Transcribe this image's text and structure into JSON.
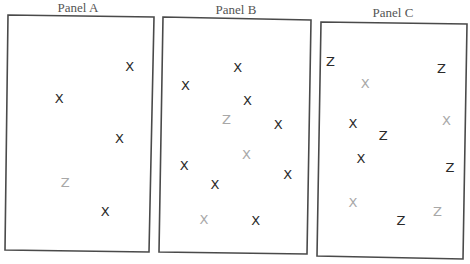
{
  "figure": {
    "colors": {
      "dark": "#2a2a2a",
      "light": "#a8a8a8"
    },
    "panels": [
      {
        "id": "a",
        "title": "Panel A",
        "items": [
          {
            "letter": "X",
            "shade": "dark",
            "pos": [
              0.84,
              0.21
            ]
          },
          {
            "letter": "X",
            "shade": "dark",
            "pos": [
              0.36,
              0.35
            ]
          },
          {
            "letter": "X",
            "shade": "dark",
            "pos": [
              0.78,
              0.52
            ]
          },
          {
            "letter": "Z",
            "shade": "light",
            "pos": [
              0.41,
              0.71
            ]
          },
          {
            "letter": "X",
            "shade": "dark",
            "pos": [
              0.69,
              0.83
            ]
          }
        ]
      },
      {
        "id": "b",
        "title": "Panel B",
        "items": [
          {
            "letter": "X",
            "shade": "dark",
            "pos": [
              0.51,
              0.21
            ]
          },
          {
            "letter": "X",
            "shade": "dark",
            "pos": [
              0.16,
              0.29
            ]
          },
          {
            "letter": "X",
            "shade": "dark",
            "pos": [
              0.58,
              0.35
            ]
          },
          {
            "letter": "Z",
            "shade": "light",
            "pos": [
              0.44,
              0.43
            ]
          },
          {
            "letter": "X",
            "shade": "dark",
            "pos": [
              0.79,
              0.45
            ]
          },
          {
            "letter": "X",
            "shade": "light",
            "pos": [
              0.58,
              0.58
            ]
          },
          {
            "letter": "X",
            "shade": "dark",
            "pos": [
              0.16,
              0.63
            ]
          },
          {
            "letter": "X",
            "shade": "dark",
            "pos": [
              0.86,
              0.66
            ]
          },
          {
            "letter": "X",
            "shade": "dark",
            "pos": [
              0.37,
              0.71
            ]
          },
          {
            "letter": "X",
            "shade": "light",
            "pos": [
              0.3,
              0.86
            ]
          },
          {
            "letter": "X",
            "shade": "dark",
            "pos": [
              0.65,
              0.86
            ]
          }
        ]
      },
      {
        "id": "c",
        "title": "Panel C",
        "items": [
          {
            "letter": "Z",
            "shade": "dark",
            "pos": [
              0.07,
              0.17
            ]
          },
          {
            "letter": "Z",
            "shade": "dark",
            "pos": [
              0.83,
              0.19
            ]
          },
          {
            "letter": "X",
            "shade": "light",
            "pos": [
              0.31,
              0.26
            ]
          },
          {
            "letter": "X",
            "shade": "light",
            "pos": [
              0.87,
              0.41
            ]
          },
          {
            "letter": "X",
            "shade": "dark",
            "pos": [
              0.23,
              0.43
            ]
          },
          {
            "letter": "Z",
            "shade": "dark",
            "pos": [
              0.44,
              0.48
            ]
          },
          {
            "letter": "X",
            "shade": "dark",
            "pos": [
              0.29,
              0.58
            ]
          },
          {
            "letter": "Z",
            "shade": "dark",
            "pos": [
              0.9,
              0.61
            ]
          },
          {
            "letter": "X",
            "shade": "light",
            "pos": [
              0.24,
              0.77
            ]
          },
          {
            "letter": "Z",
            "shade": "light",
            "pos": [
              0.82,
              0.8
            ]
          },
          {
            "letter": "Z",
            "shade": "dark",
            "pos": [
              0.57,
              0.84
            ]
          }
        ]
      }
    ]
  }
}
